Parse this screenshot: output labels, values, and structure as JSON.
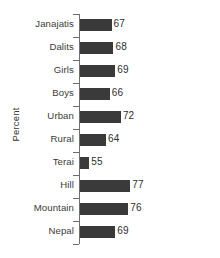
{
  "chart_data": {
    "type": "bar",
    "orientation": "horizontal",
    "title": "",
    "subtitle": "",
    "xlabel": "",
    "ylabel": "Percent",
    "grid": false,
    "legend": null,
    "legend_position": "none",
    "axis_baseline": 50,
    "axis_max": 82,
    "bar_color": "#3a3a3a",
    "axis_color": "#6f6f6f",
    "text_color": "#3b3b3b",
    "background_color": "#ffffff",
    "categories": [
      "Janajatis",
      "Dalits",
      "Girls",
      "Boys",
      "Urban",
      "Rural",
      "Terai",
      "Hill",
      "Mountain",
      "Nepal"
    ],
    "values": [
      67,
      68,
      69,
      66,
      72,
      64,
      55,
      77,
      76,
      69
    ],
    "value_labels": [
      "67",
      "68",
      "69",
      "66",
      "72",
      "64",
      "55",
      "77",
      "76",
      "69"
    ]
  }
}
